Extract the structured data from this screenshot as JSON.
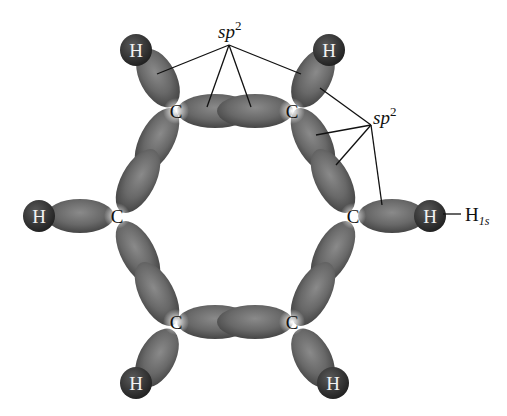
{
  "figure": {
    "atoms": {
      "carbon_label": "C",
      "hydrogen_label": "H"
    },
    "annotations": {
      "top_sp2": {
        "base": "sp",
        "sup": "2"
      },
      "right_sp2": {
        "base": "sp",
        "sup": "2"
      },
      "h1s": {
        "base": "H",
        "sub": "1s"
      }
    },
    "colors": {
      "lobe": "#6e6e6e",
      "lobe_dark": "#3d3d3d",
      "hydrogen": "#3a3a3a",
      "background": "#ffffff",
      "line": "#111111"
    }
  }
}
